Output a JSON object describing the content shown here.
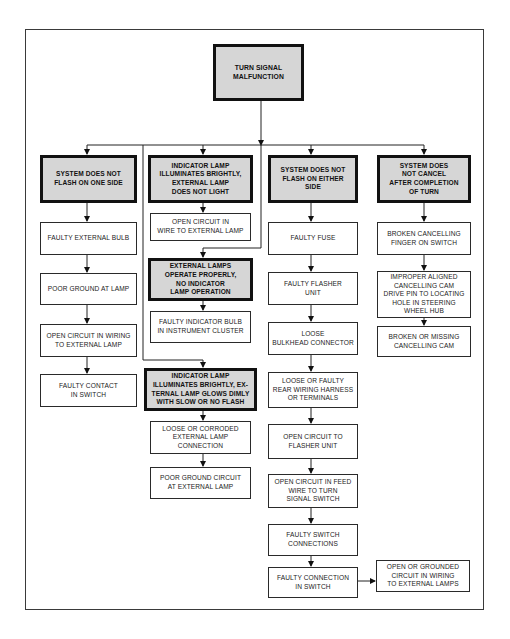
{
  "diagram": {
    "title": "TURN SIGNAL MALFUNCTION",
    "colors": {
      "header_fill": "#d6d6d6",
      "border": "#111111",
      "background": "#ffffff"
    },
    "root": {
      "id": "root",
      "label": "TURN SIGNAL\nMALFUNCTION"
    },
    "columns": [
      {
        "id": "col1",
        "symptom": "SYSTEM DOES NOT\nFLASH ON ONE SIDE",
        "causes": [
          "FAULTY EXTERNAL BULB",
          "POOR GROUND AT LAMP",
          "OPEN CIRCUIT IN WIRING\nTO EXTERNAL LAMP",
          "FAULTY CONTACT\nIN SWITCH"
        ]
      },
      {
        "id": "col2",
        "symptom": "INDICATOR LAMP\nILLUMINATES BRIGHTLY,\nEXTERNAL LAMP\nDOES NOT LIGHT",
        "causes": [
          "OPEN CIRCUIT IN\nWIRE TO EXTERNAL LAMP"
        ]
      },
      {
        "id": "col2b",
        "symptom": "EXTERNAL LAMPS\nOPERATE PROPERLY,\nNO INDICATOR\nLAMP OPERATION",
        "causes": [
          "FAULTY INDICATOR BULB\nIN INSTRUMENT CLUSTER"
        ]
      },
      {
        "id": "col2c",
        "symptom": "INDICATOR LAMP\nILLUMINATES BRIGHTLY, EX-\nTERNAL LAMP GLOWS DIMLY\nWITH SLOW OR NO FLASH",
        "causes": [
          "LOOSE OR CORRODED\nEXTERNAL LAMP\nCONNECTION",
          "POOR GROUND CIRCUIT\nAT EXTERNAL LAMP"
        ]
      },
      {
        "id": "col3",
        "symptom": "SYSTEM DOES NOT\nFLASH ON EITHER SIDE",
        "causes": [
          "FAULTY FUSE",
          "FAULTY FLASHER\nUNIT",
          "LOOSE\nBULKHEAD CONNECTOR",
          "LOOSE OR FAULTY\nREAR WIRING HARNESS\nOR TERMINALS",
          "OPEN CIRCUIT TO\nFLASHER UNIT",
          "OPEN CIRCUIT IN FEED\nWIRE TO TURN\nSIGNAL SWITCH",
          "FAULTY SWITCH\nCONNECTIONS",
          "FAULTY CONNECTION\nIN SWITCH"
        ],
        "side_branch": "OPEN OR GROUNDED\nCIRCUIT IN WIRING\nTO EXTERNAL LAMPS"
      },
      {
        "id": "col4",
        "symptom": "SYSTEM DOES\nNOT CANCEL\nAFTER COMPLETION\nOF TURN",
        "causes": [
          "BROKEN CANCELLING\nFINGER ON SWITCH",
          "IMPROPER ALIGNED\nCANCELLING CAM\nDRIVE PIN TO LOCATING\nHOLE IN STEERING\nWHEEL HUB",
          "BROKEN OR MISSING\nCANCELLING CAM"
        ]
      }
    ]
  }
}
